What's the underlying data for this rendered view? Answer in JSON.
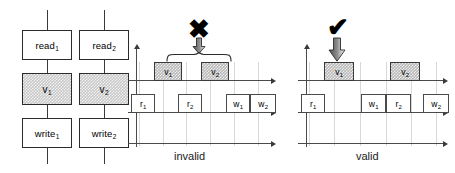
{
  "diagram": {
    "title_absent": true,
    "flowchart": {
      "name": "transaction-flowchart",
      "columns": [
        {
          "id": "t1",
          "nodes": [
            {
              "id": "read1",
              "label": "read",
              "sub": "1",
              "shaded": false
            },
            {
              "id": "v1",
              "label": "v",
              "sub": "1",
              "shaded": true
            },
            {
              "id": "write1",
              "label": "write",
              "sub": "1",
              "shaded": false
            }
          ]
        },
        {
          "id": "t2",
          "nodes": [
            {
              "id": "read2",
              "label": "read",
              "sub": "2",
              "shaded": false
            },
            {
              "id": "v2",
              "label": "v",
              "sub": "2",
              "shaded": true
            },
            {
              "id": "write2",
              "label": "write",
              "sub": "2",
              "shaded": false
            }
          ]
        }
      ]
    },
    "panels": [
      {
        "id": "invalid",
        "verdict": "invalid",
        "mark": "✖",
        "mark_name": "cross-mark",
        "brace": true,
        "validation_row": [
          {
            "id": "v1",
            "label": "v",
            "sub": "1",
            "shaded": true,
            "x": 26,
            "w": 28
          },
          {
            "id": "v2",
            "label": "v",
            "sub": "2",
            "shaded": true,
            "x": 73,
            "w": 28
          }
        ],
        "operation_row": [
          {
            "id": "r1",
            "label": "r",
            "sub": "1",
            "shaded": false,
            "x": 3,
            "w": 24
          },
          {
            "id": "r2",
            "label": "r",
            "sub": "2",
            "shaded": false,
            "x": 50,
            "w": 24
          },
          {
            "id": "w1",
            "label": "w",
            "sub": "1",
            "shaded": false,
            "x": 98,
            "w": 24
          },
          {
            "id": "w2",
            "label": "w",
            "sub": "2",
            "shaded": false,
            "x": 122,
            "w": 26
          }
        ]
      },
      {
        "id": "valid",
        "verdict": "valid",
        "mark": "✔",
        "mark_name": "check-mark",
        "brace": false,
        "validation_row": [
          {
            "id": "v1",
            "label": "v",
            "sub": "1",
            "shaded": true,
            "x": 26,
            "w": 30
          },
          {
            "id": "v2",
            "label": "v",
            "sub": "2",
            "shaded": true,
            "x": 92,
            "w": 30
          }
        ],
        "operation_row": [
          {
            "id": "r1",
            "label": "r",
            "sub": "1",
            "shaded": false,
            "x": 3,
            "w": 24
          },
          {
            "id": "w1",
            "label": "w",
            "sub": "1",
            "shaded": false,
            "x": 63,
            "w": 25
          },
          {
            "id": "r2",
            "label": "r",
            "sub": "2",
            "shaded": false,
            "x": 88,
            "w": 25
          },
          {
            "id": "w2",
            "label": "w",
            "sub": "2",
            "shaded": false,
            "x": 125,
            "w": 26
          }
        ]
      }
    ],
    "colors": {
      "shade_fill": "#bfbfbf",
      "stroke": "#3a3a3a",
      "grid": "#d8d8d8",
      "background": "#ffffff"
    }
  }
}
